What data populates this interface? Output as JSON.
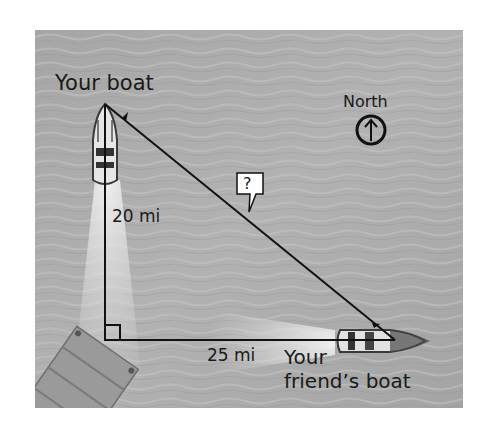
{
  "diagram": {
    "type": "right-triangle word problem",
    "labels": {
      "your_boat": "Your boat",
      "friends_boat_line1": "Your",
      "friends_boat_line2": "friend’s boat",
      "north": "North",
      "vertical_leg": "20 mi",
      "horizontal_leg": "25 mi",
      "hypotenuse": "?"
    },
    "legs": {
      "vertical_mi": 20,
      "horizontal_mi": 25,
      "hypotenuse": "unknown"
    },
    "icons": {
      "compass": "north-arrow-icon",
      "right_angle": "right-angle-marker"
    },
    "colors": {
      "water": "#a8a8a8",
      "line": "#111111",
      "text": "#1a1a1a",
      "callout_bg": "#ffffff"
    }
  }
}
